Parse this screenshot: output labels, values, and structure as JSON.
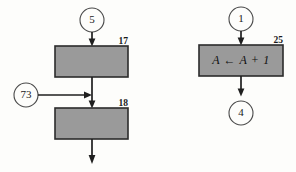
{
  "diagram": {
    "background_color": "#fdfdfb",
    "box_fill_color": "#9a9a9a",
    "box_border_color": "#2b2b2b",
    "line_color": "#1f1f1f",
    "circle_fill_color": "#fdfdfb",
    "circle_border_color": "#4a4a4a"
  },
  "left_fragment": {
    "entry_connector_label": "5",
    "side_connector_label": "73",
    "first_box": {
      "number_label": "17",
      "statement": ""
    },
    "second_box": {
      "number_label": "18",
      "statement": ""
    }
  },
  "right_fragment": {
    "entry_connector_label": "1",
    "exit_connector_label": "4",
    "box": {
      "number_label": "25",
      "statement": "A ← A + 1"
    }
  }
}
